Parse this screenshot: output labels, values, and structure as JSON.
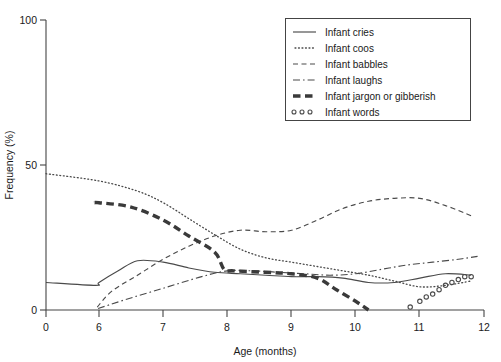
{
  "chart_data": {
    "type": "line",
    "title": "",
    "xlabel": "Age (months)",
    "ylabel": "Frequency (%)",
    "xlim": [
      0,
      12
    ],
    "ylim": [
      0,
      100
    ],
    "xticks": [
      0,
      6,
      7,
      8,
      9,
      10,
      11,
      12
    ],
    "xtick_labels": [
      "0",
      "6",
      "7",
      "8",
      "9",
      "10",
      "11",
      "12"
    ],
    "yticks": [
      0,
      50,
      100
    ],
    "ytick_labels": [
      "0",
      "50",
      "100"
    ],
    "grid": false,
    "legend_position": "top-right",
    "note": "X axis is broken: the 0 tick sits at the origin and the spacing from 0 to 6 equals one month-unit of the 6-12 range.",
    "series": [
      {
        "name": "Infant cries",
        "style": "solid",
        "x": [
          0.0,
          5.6,
          6.0,
          6.3,
          6.6,
          7.0,
          7.4,
          7.8,
          8.2,
          8.6,
          9.0,
          9.4,
          9.8,
          10.2,
          10.6,
          11.0,
          11.4,
          11.8
        ],
        "y": [
          9.5,
          8.5,
          9.5,
          13.5,
          17.0,
          16.5,
          14.5,
          13.0,
          12.5,
          12.0,
          11.5,
          11.5,
          11.0,
          9.5,
          9.5,
          11.0,
          12.5,
          12.0
        ]
      },
      {
        "name": "Infant coos",
        "style": "dotted",
        "x": [
          0.0,
          6.0,
          6.6,
          7.0,
          7.4,
          7.8,
          8.2,
          8.6,
          9.0,
          9.4,
          9.8,
          10.2,
          10.6,
          11.0,
          11.4,
          11.8
        ],
        "y": [
          47.0,
          44.5,
          41.0,
          37.0,
          31.5,
          26.0,
          21.0,
          18.0,
          16.5,
          15.0,
          13.5,
          12.0,
          10.0,
          8.0,
          8.5,
          10.0
        ]
      },
      {
        "name": "Infant babbles",
        "style": "dashed",
        "x": [
          5.8,
          6.2,
          6.6,
          7.0,
          7.4,
          7.8,
          8.2,
          8.6,
          9.0,
          9.4,
          9.8,
          10.2,
          10.6,
          11.0,
          11.4,
          11.8
        ],
        "y": [
          1.0,
          6.5,
          12.0,
          17.5,
          22.0,
          25.5,
          27.5,
          27.0,
          27.5,
          31.0,
          35.0,
          37.5,
          38.5,
          38.5,
          36.0,
          32.5
        ]
      },
      {
        "name": "Infant laughs",
        "style": "dash-dot",
        "x": [
          5.9,
          6.4,
          7.0,
          7.6,
          8.0,
          8.4,
          8.8,
          9.2,
          9.6,
          10.0,
          10.4,
          10.8,
          11.2,
          11.6,
          11.9
        ],
        "y": [
          0.5,
          3.5,
          7.5,
          11.5,
          13.5,
          13.5,
          13.0,
          12.5,
          12.0,
          12.5,
          14.0,
          15.5,
          16.5,
          17.5,
          18.5
        ]
      },
      {
        "name": "Infant jargon or gibberish",
        "style": "thick-dashed",
        "x": [
          5.5,
          6.0,
          6.5,
          7.0,
          7.4,
          7.8,
          7.95,
          8.1,
          8.6,
          9.0,
          9.4,
          9.7,
          10.0,
          10.2
        ],
        "y": [
          37.0,
          37.0,
          35.5,
          31.0,
          25.5,
          20.0,
          14.0,
          13.5,
          13.0,
          12.5,
          11.0,
          7.0,
          3.0,
          0.0
        ]
      },
      {
        "name": "Infant words",
        "style": "circle-markers",
        "x": [
          10.85,
          11.0,
          11.1,
          11.2,
          11.3,
          11.4,
          11.5,
          11.6,
          11.7,
          11.8
        ],
        "y": [
          1.0,
          3.0,
          4.5,
          5.5,
          7.0,
          8.5,
          9.5,
          10.5,
          11.5,
          11.5
        ]
      }
    ]
  },
  "legend": {
    "items": [
      {
        "label": "Infant cries",
        "swatch": "solid-line-swatch"
      },
      {
        "label": "Infant coos",
        "swatch": "dotted-line-swatch"
      },
      {
        "label": "Infant babbles",
        "swatch": "dashed-line-swatch"
      },
      {
        "label": "Infant laughs",
        "swatch": "dash-dot-line-swatch"
      },
      {
        "label": "Infant jargon or gibberish",
        "swatch": "thick-dashed-line-swatch"
      },
      {
        "label": "Infant words",
        "swatch": "circle-marker-swatch"
      }
    ]
  },
  "axes": {
    "x_title": "Age (months)",
    "y_title": "Frequency (%)",
    "x_tick_labels": [
      "0",
      "6",
      "7",
      "8",
      "9",
      "10",
      "11",
      "12"
    ],
    "y_tick_labels": [
      "0",
      "50",
      "100"
    ]
  },
  "colors": {
    "line": "#4a4a4a",
    "jargon": "#3a3a3a",
    "axis": "#444444",
    "text": "#1a1a1a",
    "background": "#ffffff"
  }
}
